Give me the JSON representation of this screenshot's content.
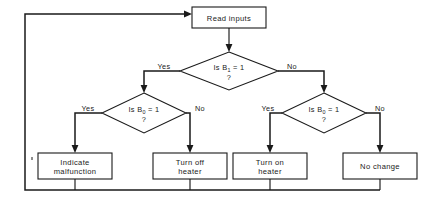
{
  "diagram": {
    "type": "flowchart",
    "colors": {
      "background": "#ffffff",
      "stroke": "#1a1a1a",
      "shape_fill": "#ffffff"
    },
    "nodes": {
      "read_inputs": {
        "shape": "process",
        "label": "Read inputs"
      },
      "decision_b1": {
        "shape": "decision",
        "line1_prefix": "Is B",
        "line1_subscript": "1",
        "line1_suffix": " = 1",
        "line2": "?",
        "label_full": "Is B1 = 1 ?"
      },
      "decision_b0_left": {
        "shape": "decision",
        "line1_prefix": "Is B",
        "line1_subscript": "0",
        "line1_suffix": " = 1",
        "line2": "?",
        "label_full": "Is B0 = 1 ?"
      },
      "decision_b0_right": {
        "shape": "decision",
        "line1_prefix": "Is B",
        "line1_subscript": "0",
        "line1_suffix": " = 1",
        "line2": "?",
        "label_full": "Is B0 = 1 ?"
      },
      "indicate_malfunction": {
        "shape": "process",
        "line1": "Indicate",
        "line2": "malfunction"
      },
      "turn_off_heater": {
        "shape": "process",
        "line1": "Turn off",
        "line2": "heater"
      },
      "turn_on_heater": {
        "shape": "process",
        "line1": "Turn on",
        "line2": "heater"
      },
      "no_change": {
        "shape": "process",
        "line1": "No change",
        "line2": ""
      }
    },
    "branch_labels": {
      "b1_yes": "Yes",
      "b1_no": "No",
      "b0_left_yes": "Yes",
      "b0_left_no": "No",
      "b0_right_yes": "Yes",
      "b0_right_no": "No"
    }
  }
}
